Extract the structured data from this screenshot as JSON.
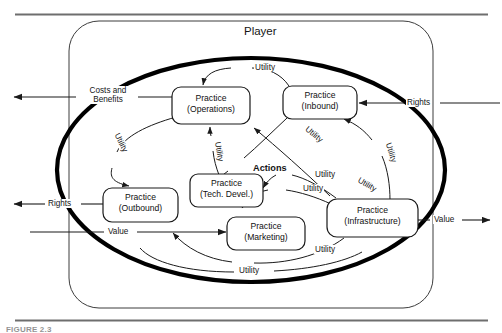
{
  "figure": {
    "title": "Player",
    "caption": "FIGURE 2.3",
    "boundary_shape": "rounded-rectangle",
    "inner_shape": "thick-ellipse"
  },
  "nodes": [
    {
      "id": "operations",
      "line1": "Practice",
      "line2": "(Operations)"
    },
    {
      "id": "inbound",
      "line1": "Practice",
      "line2": "(Inbound)"
    },
    {
      "id": "outbound",
      "line1": "Practice",
      "line2": "(Outbound)"
    },
    {
      "id": "tech-devel",
      "line1": "Practice",
      "line2": "(Tech. Devel.)"
    },
    {
      "id": "marketing",
      "line1": "Practice",
      "line2": "(Marketing)"
    },
    {
      "id": "infrastructure",
      "line1": "Practice",
      "line2": "(Infrastructure)"
    }
  ],
  "group_labels": [
    {
      "id": "actions",
      "text": "Actions"
    }
  ],
  "boundary_flows": [
    {
      "id": "costs-and-benefits",
      "line1": "Costs and",
      "line2": "Benefits",
      "direction": "out-left"
    },
    {
      "id": "rights-left",
      "text": "Rights",
      "direction": "out-left"
    },
    {
      "id": "rights-right",
      "text": "Rights",
      "direction": "in-left"
    },
    {
      "id": "value-left",
      "text": "Value",
      "direction": "in-right"
    },
    {
      "id": "value-right",
      "text": "Value",
      "direction": "out-right"
    }
  ],
  "utility_labels": [
    {
      "id": "utility-top",
      "text": "Utility",
      "rotation": 0
    },
    {
      "id": "utility-left-arc",
      "text": "Utility",
      "rotation": 64
    },
    {
      "id": "utility-ops-up",
      "text": "Utility",
      "rotation": 80
    },
    {
      "id": "utility-inbound-right",
      "text": "Utility",
      "rotation": 72
    },
    {
      "id": "utility-infra-up",
      "text": "Utility",
      "rotation": 78
    },
    {
      "id": "utility-mid-right",
      "text": "Utility",
      "rotation": 0
    },
    {
      "id": "utility-mid-right-2",
      "text": "Utility",
      "rotation": 0
    },
    {
      "id": "utility-tech-in",
      "text": "Utility",
      "rotation": 30
    },
    {
      "id": "utility-marketing-arc",
      "text": "Utility",
      "rotation": 0
    },
    {
      "id": "utility-bottom",
      "text": "Utility",
      "rotation": 0
    }
  ],
  "colors": {
    "stroke": "#1a1a1a",
    "thick_stroke": "#000000",
    "background": "#ffffff",
    "rule": "#6e6e6e"
  }
}
